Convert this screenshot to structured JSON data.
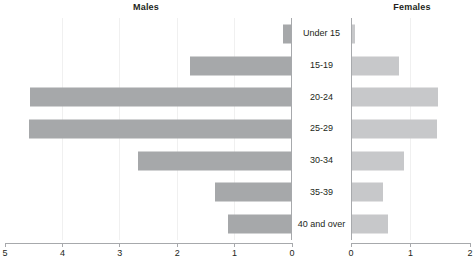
{
  "panels": {
    "left_title": "Males",
    "right_title": "Females"
  },
  "colors": {
    "male_bar": "#a6a8aa",
    "female_bar": "#c7c8ca",
    "axis": "#a7a9ac",
    "text": "#231f20",
    "gridline": "#f0f0f0",
    "background": "#ffffff"
  },
  "chart_data": {
    "type": "bar",
    "title": "",
    "subtitle": "",
    "xlabel": "",
    "ylabel": "",
    "orientation": "horizontal",
    "layout": "population-pyramid",
    "grid": true,
    "legend_position": "none",
    "categories": [
      "Under 15",
      "15-19",
      "20-24",
      "25-29",
      "30-34",
      "35-39",
      "40 and over"
    ],
    "series": [
      {
        "name": "Males",
        "axis": "left",
        "axis_direction": "right-to-left",
        "xlim": [
          0,
          5
        ],
        "ticks": [
          5,
          4,
          3,
          2,
          1,
          0
        ],
        "tick_labels": [
          "5",
          "4",
          "3",
          "2",
          "1",
          "0"
        ],
        "values": [
          0.15,
          1.78,
          4.56,
          4.59,
          2.68,
          1.34,
          1.11
        ]
      },
      {
        "name": "Females",
        "axis": "right",
        "axis_direction": "left-to-right",
        "xlim": [
          0,
          2
        ],
        "ticks": [
          0,
          1,
          2
        ],
        "tick_labels": [
          "0",
          "1",
          "2"
        ],
        "values": [
          0.07,
          0.81,
          1.46,
          1.44,
          0.89,
          0.54,
          0.62
        ]
      }
    ]
  }
}
